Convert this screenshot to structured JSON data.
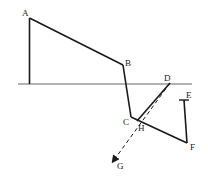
{
  "diagram": {
    "labels": {
      "A": "A",
      "B": "B",
      "C": "C",
      "D": "D",
      "E": "E",
      "F": "F",
      "G": "G",
      "H": "H"
    },
    "colors": {
      "stroke": "#1a1a1a",
      "baseline": "#555555",
      "background": "#ffffff"
    }
  }
}
